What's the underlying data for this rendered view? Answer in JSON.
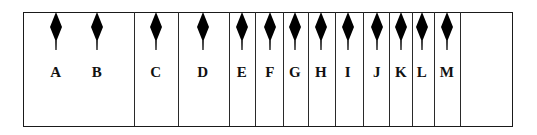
{
  "diagram": {
    "frame": {
      "left": 23,
      "top": 12,
      "right": 512,
      "bottom": 126
    },
    "dividers_x": [
      134,
      178,
      229,
      255,
      283,
      308,
      335,
      363,
      389,
      412,
      434,
      460
    ],
    "markers": [
      {
        "label": "A",
        "x": 56
      },
      {
        "label": "B",
        "x": 97
      },
      {
        "label": "C",
        "x": 156
      },
      {
        "label": "D",
        "x": 203
      },
      {
        "label": "E",
        "x": 242
      },
      {
        "label": "F",
        "x": 270
      },
      {
        "label": "G",
        "x": 295
      },
      {
        "label": "H",
        "x": 321
      },
      {
        "label": "I",
        "x": 348
      },
      {
        "label": "J",
        "x": 377
      },
      {
        "label": "K",
        "x": 401
      },
      {
        "label": "L",
        "x": 422
      },
      {
        "label": "M",
        "x": 447
      }
    ],
    "colors": {
      "line": "#1a1a1a",
      "marker": "#000000",
      "background": "#ffffff"
    }
  }
}
